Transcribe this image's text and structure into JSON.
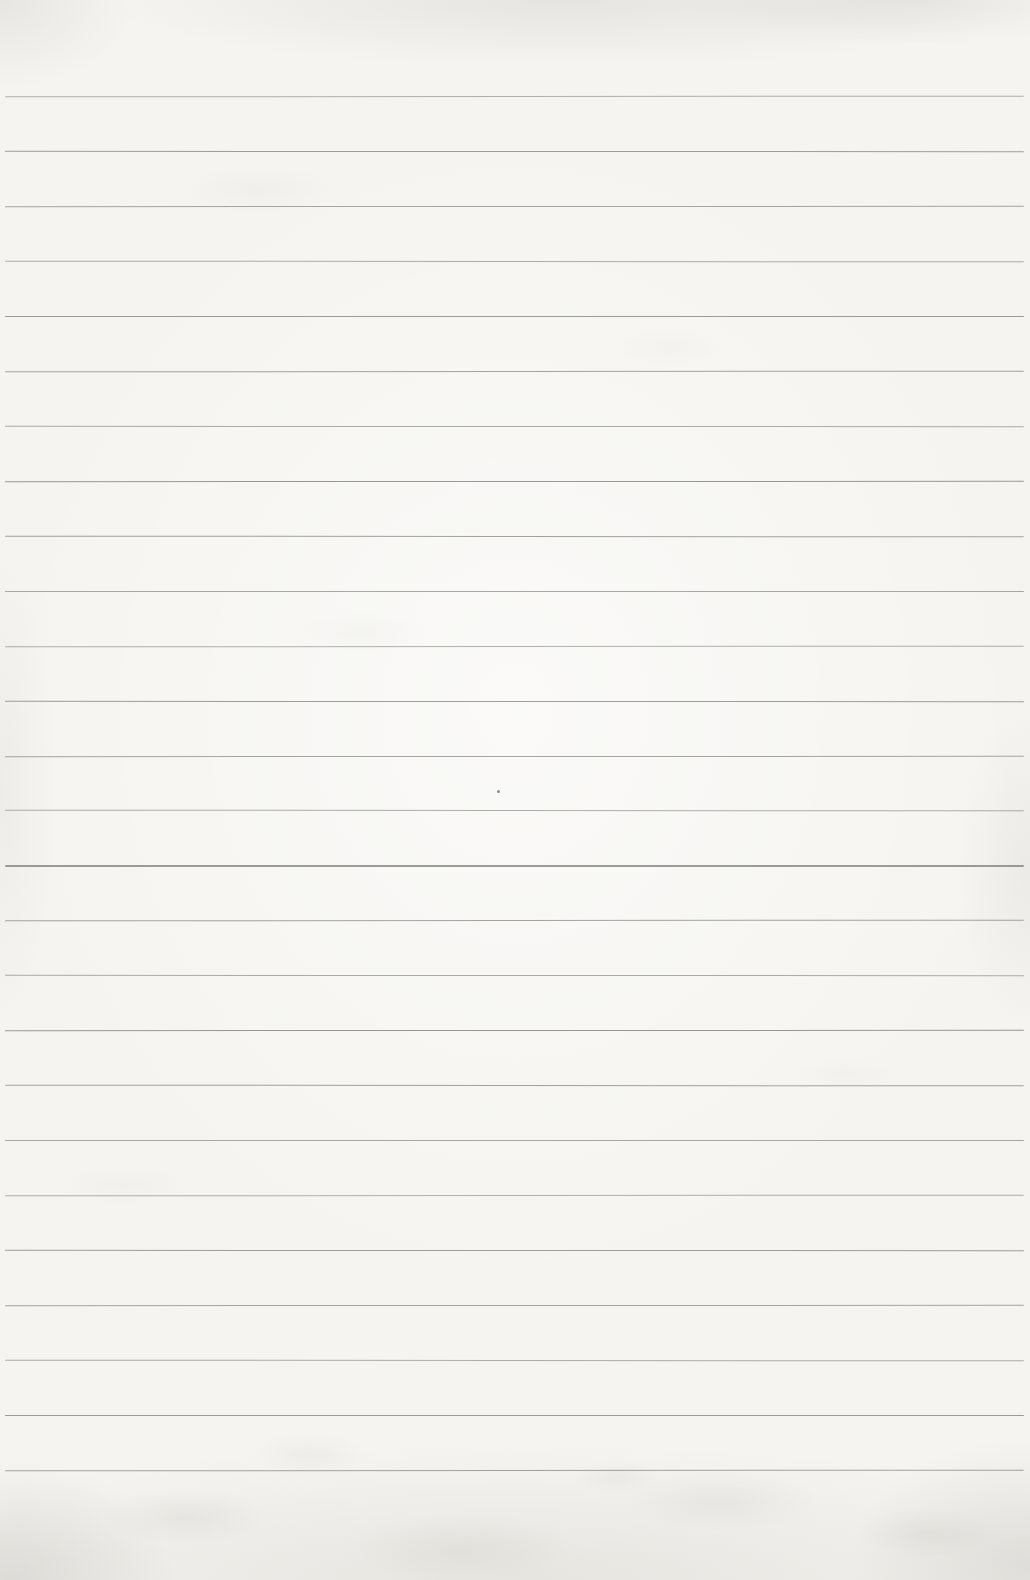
{
  "page": {
    "type": "scanned blank ruled notebook page",
    "text_content": "",
    "paper_color": "#f5f4f0",
    "line_color": "#85847f",
    "ruled_lines": {
      "count": 26,
      "first_y": 96,
      "spacing_y": 54.96,
      "start_x": 5,
      "end_x": 1024,
      "thickness": 1.2
    },
    "artifacts": {
      "speck_x": 497,
      "speck_y": 790
    }
  }
}
